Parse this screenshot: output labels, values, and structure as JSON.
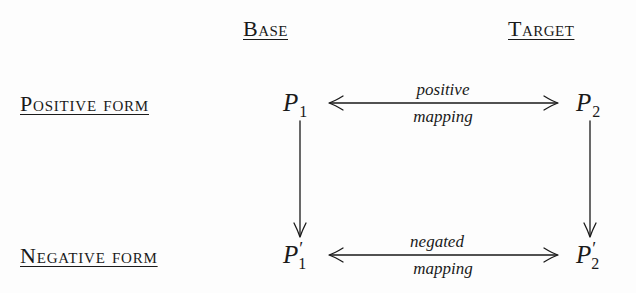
{
  "columns": {
    "base": "Base",
    "target": "Target"
  },
  "rows": {
    "positive": "Positive form",
    "negative": "Negative form"
  },
  "nodes": {
    "p1": {
      "symbol": "P",
      "subscript": "1",
      "prime": ""
    },
    "p2": {
      "symbol": "P",
      "subscript": "2",
      "prime": ""
    },
    "p1_neg": {
      "symbol": "P",
      "subscript": "1",
      "prime": "′"
    },
    "p2_neg": {
      "symbol": "P",
      "subscript": "2",
      "prime": "′"
    }
  },
  "edges": {
    "positive_mapping": {
      "top": "positive",
      "bottom": "mapping",
      "direction": "bidirectional"
    },
    "negated_mapping": {
      "top": "negated",
      "bottom": "mapping",
      "direction": "bidirectional"
    },
    "base_down": {
      "direction": "down"
    },
    "target_down": {
      "direction": "down"
    }
  },
  "colors": {
    "ink": "#1a1a1a",
    "background": "#fdfdfd"
  }
}
